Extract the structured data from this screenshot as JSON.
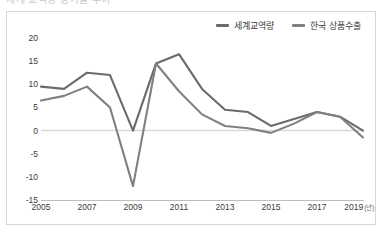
{
  "top_clip_text": "세계 교역량 증가율 추이",
  "chart_data": {
    "type": "line",
    "title": "",
    "subtitle": "",
    "xlabel": "(년)",
    "ylabel": "",
    "x": [
      2005,
      2006,
      2007,
      2008,
      2009,
      2010,
      2011,
      2012,
      2013,
      2014,
      2015,
      2016,
      2017,
      2018,
      2019
    ],
    "xlim": [
      2005,
      2019
    ],
    "ylim": [
      -15,
      20
    ],
    "yticks": [
      20,
      15,
      10,
      5,
      0,
      -5,
      -10,
      -15
    ],
    "xticks": [
      2005,
      2007,
      2009,
      2011,
      2013,
      2015,
      2017,
      2019
    ],
    "grid": false,
    "zero_line": true,
    "legend_position": "top-right",
    "series": [
      {
        "name": "세계교역량",
        "color": "#6b6b6b",
        "values": [
          9.5,
          9.0,
          12.5,
          12.0,
          0.0,
          14.5,
          16.5,
          9.0,
          4.5,
          4.0,
          1.0,
          2.5,
          4.0,
          3.0,
          0.0
        ]
      },
      {
        "name": "한국 상품수출",
        "color": "#808080",
        "values": [
          6.5,
          7.5,
          9.5,
          5.0,
          -12.0,
          14.5,
          8.5,
          3.5,
          1.0,
          0.5,
          -0.5,
          1.5,
          4.0,
          3.0,
          -1.5
        ]
      }
    ]
  },
  "legend": {
    "items": [
      {
        "label": "세계교역량",
        "color": "#6b6b6b"
      },
      {
        "label": "한국 상품수출",
        "color": "#808080"
      }
    ]
  },
  "axes": {
    "y_ticks": [
      "20",
      "15",
      "10",
      "5",
      "0",
      "-5",
      "-10",
      "-15"
    ],
    "x_ticks": [
      "2005",
      "2007",
      "2009",
      "2011",
      "2013",
      "2015",
      "2017",
      "2019"
    ],
    "x_unit": "(년)"
  }
}
